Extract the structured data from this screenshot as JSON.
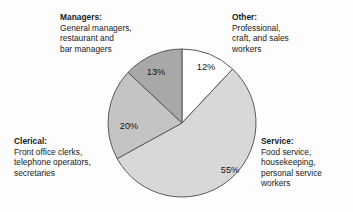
{
  "chart_data": {
    "type": "pie",
    "title": "",
    "categories": [
      "Other",
      "Service",
      "Clerical",
      "Managers"
    ],
    "values": [
      12,
      55,
      20,
      13
    ],
    "labels": [
      "12%",
      "55%",
      "20%",
      "13%"
    ],
    "units": "percent",
    "start_angle_deg": 0,
    "direction": "clockwise",
    "legend_position": "callouts around pie",
    "grid": false,
    "slice_colors": [
      "#ffffff",
      "#d8d8d8",
      "#c4c4c4",
      "#a8a8a8"
    ],
    "outline_color": "#5a5a5a",
    "series": [
      {
        "name": "Occupational distribution",
        "values": [
          12,
          55,
          20,
          13
        ]
      }
    ]
  },
  "pie": {
    "center_x": 182,
    "center_y": 123,
    "radius": 74,
    "slices": [
      {
        "key": "other",
        "percent_label": "12%",
        "value": 12,
        "color": "#ffffff",
        "label_x": 206,
        "label_y": 70
      },
      {
        "key": "service",
        "percent_label": "55%",
        "value": 55,
        "color": "#d8d8d8",
        "label_x": 230,
        "label_y": 173
      },
      {
        "key": "clerical",
        "percent_label": "20%",
        "value": 20,
        "color": "#c4c4c4",
        "label_x": 129,
        "label_y": 129
      },
      {
        "key": "managers",
        "percent_label": "13%",
        "value": 13,
        "color": "#a8a8a8",
        "label_x": 156,
        "label_y": 75
      }
    ]
  },
  "callouts": {
    "managers": {
      "head": "Managers:",
      "lines": [
        "General managers,",
        "restaurant and",
        "bar managers"
      ]
    },
    "other": {
      "head": "Other:",
      "lines": [
        "Professional,",
        "craft, and sales",
        "workers"
      ]
    },
    "clerical": {
      "head": "Clerical:",
      "lines": [
        "Front office clerks,",
        "telephone operators,",
        "secretaries"
      ]
    },
    "service": {
      "head": "Service:",
      "lines": [
        "Food service,",
        "housekeeping,",
        "personal service",
        "workers"
      ]
    }
  }
}
